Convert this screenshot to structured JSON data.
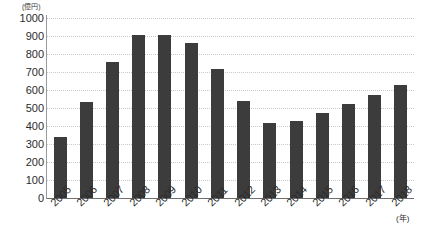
{
  "chart_data": {
    "type": "bar",
    "title": "",
    "xlabel": "(年)",
    "ylabel": "(億円)",
    "ylim": [
      0,
      1000
    ],
    "ytick_step": 100,
    "yticks": [
      "1000",
      "900",
      "800",
      "700",
      "600",
      "500",
      "400",
      "300",
      "200",
      "100",
      "0"
    ],
    "grid": true,
    "legend": "none",
    "bar_color": "#3c3c3c",
    "grid_color": "#c9c9c9",
    "axis_color": "#9a9a9a",
    "categories": [
      "2005",
      "2006",
      "2007",
      "2008",
      "2009",
      "2010",
      "2011",
      "2012",
      "2013",
      "2014",
      "2015",
      "2016",
      "2017",
      "2018"
    ],
    "values": [
      340,
      535,
      755,
      905,
      905,
      860,
      715,
      540,
      415,
      430,
      470,
      525,
      570,
      630
    ]
  }
}
